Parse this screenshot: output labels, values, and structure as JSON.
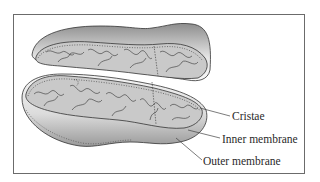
{
  "figure": {
    "labels": {
      "cristae": "Cristae",
      "inner_membrane": "Inner membrane",
      "outer_membrane": "Outer membrane"
    }
  },
  "colors": {
    "frame_border": "#6b6b6b",
    "outline": "#333333",
    "matrix_fill": "#c9c9c9",
    "shell_light": "#f2f2f2",
    "shell_dark": "#8a8a8a",
    "text": "#2a2a2a"
  }
}
